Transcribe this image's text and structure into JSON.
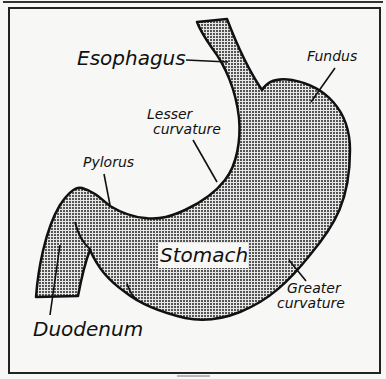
{
  "figure": {
    "type": "anatomical-diagram",
    "subject": "Stomach",
    "fill_pattern": "dot-screen",
    "colors": {
      "outline": "#111111",
      "fill": "#9a9a9a",
      "background": "#f7f7f5"
    }
  },
  "labels": {
    "esophagus": "Esophagus",
    "fundus": "Fundus",
    "lesser_curvature_line1": "Lesser",
    "lesser_curvature_line2": "curvature",
    "pylorus": "Pylorus",
    "stomach": "Stomach",
    "greater_curvature_line1": "Greater",
    "greater_curvature_line2": "curvature",
    "duodenum": "Duodenum"
  }
}
